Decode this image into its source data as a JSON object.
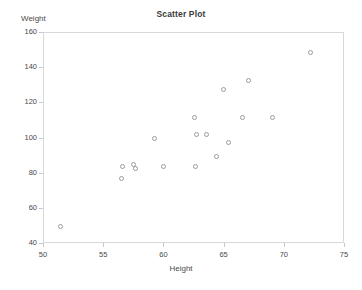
{
  "chart_data": {
    "type": "scatter",
    "title": "Scatter Plot",
    "xlabel": "Height",
    "ylabel": "Weight",
    "xlim": [
      50,
      75
    ],
    "ylim": [
      40,
      160
    ],
    "xticks": [
      50,
      55,
      60,
      65,
      70,
      75
    ],
    "yticks": [
      40,
      60,
      80,
      100,
      120,
      140,
      160
    ],
    "grid": false,
    "legend": null,
    "marker": "open-circle",
    "marker_color": "#9a9a9a",
    "points": [
      {
        "x": 51.4,
        "y": 50
      },
      {
        "x": 56.4,
        "y": 77
      },
      {
        "x": 56.5,
        "y": 84
      },
      {
        "x": 57.4,
        "y": 85
      },
      {
        "x": 57.6,
        "y": 83
      },
      {
        "x": 59.2,
        "y": 100
      },
      {
        "x": 59.9,
        "y": 84
      },
      {
        "x": 62.5,
        "y": 112
      },
      {
        "x": 62.6,
        "y": 84
      },
      {
        "x": 62.7,
        "y": 102
      },
      {
        "x": 63.5,
        "y": 102
      },
      {
        "x": 64.3,
        "y": 90
      },
      {
        "x": 64.9,
        "y": 128
      },
      {
        "x": 65.3,
        "y": 98
      },
      {
        "x": 66.5,
        "y": 112
      },
      {
        "x": 67.0,
        "y": 133
      },
      {
        "x": 69.0,
        "y": 112
      },
      {
        "x": 72.1,
        "y": 149
      }
    ]
  }
}
